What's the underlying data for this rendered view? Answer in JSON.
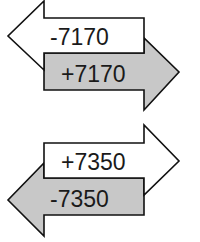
{
  "colors": {
    "white_fill": "#ffffff",
    "gray_fill": "#c8c8c8",
    "stroke": "#111111",
    "text": "#1a1a1a"
  },
  "pairs": [
    {
      "top_arrow": {
        "direction": "left",
        "fill": "white",
        "label": "-7170"
      },
      "bottom_arrow": {
        "direction": "right",
        "fill": "gray",
        "label": "+7170"
      }
    },
    {
      "top_arrow": {
        "direction": "right",
        "fill": "white",
        "label": "+7350"
      },
      "bottom_arrow": {
        "direction": "left",
        "fill": "gray",
        "label": "-7350"
      }
    }
  ]
}
